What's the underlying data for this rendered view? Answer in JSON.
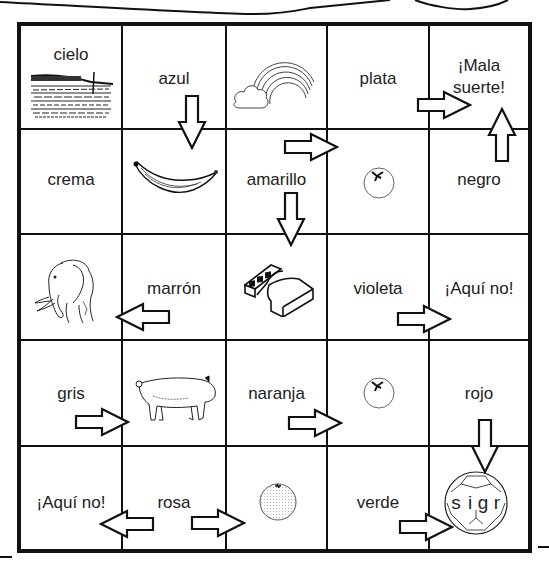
{
  "game": {
    "type": "board-game-grid",
    "rows": 5,
    "cols": 5,
    "ball_letters": "s i g r",
    "cells": [
      [
        {
          "label": "cielo",
          "picture": "sky-seascape"
        },
        {
          "label": "azul",
          "arrow": "down"
        },
        {
          "picture": "rainbow-cloud"
        },
        {
          "label": "plata",
          "arrow": "right"
        },
        {
          "label": "¡Mala suerte!",
          "label_line1": "¡Mala",
          "label_line2": "suerte!",
          "arrow": "up"
        }
      ],
      [
        {
          "label": "crema"
        },
        {
          "picture": "banana"
        },
        {
          "label": "amarillo",
          "arrows": [
            "right",
            "down"
          ]
        },
        {
          "picture": "tomato"
        },
        {
          "label": "negro"
        }
      ],
      [
        {
          "picture": "elephant"
        },
        {
          "label": "marrón",
          "arrow": "left"
        },
        {
          "picture": "chocolate-bar"
        },
        {
          "label": "violeta",
          "arrow": "right"
        },
        {
          "label": "¡Aquí no!"
        }
      ],
      [
        {
          "label": "gris",
          "arrow": "right"
        },
        {
          "picture": "pig"
        },
        {
          "label": "naranja",
          "arrow": "right"
        },
        {
          "picture": "tomato"
        },
        {
          "label": "rojo",
          "arrow": "down"
        }
      ],
      [
        {
          "label": "¡Aquí no!"
        },
        {
          "label": "rosa",
          "arrows": [
            "left",
            "right"
          ]
        },
        {
          "picture": "orange"
        },
        {
          "label": "verde",
          "arrow": "right"
        },
        {
          "picture": "soccer-ball",
          "ball_text": "s i g r"
        }
      ]
    ]
  },
  "labels": {
    "r0c0": "cielo",
    "r0c1": "azul",
    "r0c3": "plata",
    "r0c4a": "¡Mala",
    "r0c4b": "suerte!",
    "r1c0": "crema",
    "r1c2": "amarillo",
    "r1c4": "negro",
    "r2c1": "marrón",
    "r2c3": "violeta",
    "r2c4": "¡Aquí no!",
    "r3c0": "gris",
    "r3c2": "naranja",
    "r3c4": "rojo",
    "r4c0": "¡Aquí no!",
    "r4c1": "rosa",
    "r4c3": "verde"
  },
  "ball": {
    "s": "s",
    "i": "i",
    "g": "g",
    "r": "r"
  },
  "colors": {
    "ink": "#111111",
    "paper": "#ffffff",
    "text": "#222222"
  }
}
